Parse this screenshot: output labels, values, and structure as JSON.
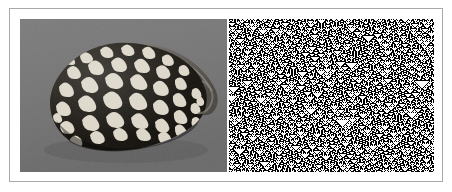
{
  "figure": {
    "caption": "",
    "width": 452,
    "height": 192,
    "background_color": "#ffffff",
    "frame_color": "#a9a9a9"
  },
  "panels": [
    {
      "id": "shell-photo",
      "label": "Conus shell photograph",
      "kind": "photograph",
      "subject": "marbled cone sea shell",
      "background_color": "#757575",
      "shell_dark_color": "#181410",
      "shell_light_color": "#d8d2c4",
      "x": 20,
      "y": 19,
      "width": 207,
      "height": 153,
      "description": "Grayscale photograph of a cone-shaped sea shell with white rounded-triangular spots tessellated over a near-black ground, lit from upper left, resting on a flat gray surface."
    },
    {
      "id": "cellular-automaton",
      "label": "Rule 90 cellular automaton",
      "kind": "cellular-automaton",
      "rule": 90,
      "rule_name": "Rule 90",
      "pattern_name": "Sierpinski triangle nesting",
      "background_color": "#ffffff",
      "cell_color": "#000000",
      "x": 229,
      "y": 19,
      "width": 205,
      "height": 153,
      "columns": 205,
      "rows": 153,
      "initial_condition": "random",
      "description": "Black-and-white cellular automaton evolution showing nested Sierpinski triangles of many sizes on a white field."
    }
  ],
  "icons": {
    "shell": "shell-icon",
    "grid": "grid-icon"
  }
}
